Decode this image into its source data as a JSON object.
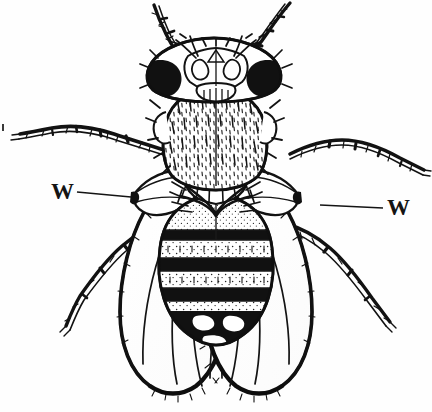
{
  "figure": {
    "kind": "scientific-line-drawing",
    "background_color": "#fefefe",
    "ink_color": "#111111",
    "width_px": 432,
    "height_px": 412
  },
  "labels": {
    "left": {
      "text": "W",
      "points_to": "left wing base",
      "leader_from_x": 77,
      "leader_from_y": 192,
      "leader_to_x": 131,
      "leader_to_y": 197
    },
    "right": {
      "text": "W",
      "points_to": "right wing base",
      "leader_from_x": 383,
      "leader_from_y": 208,
      "leader_to_x": 320,
      "leader_to_y": 205
    }
  },
  "anatomy": {
    "head": {
      "label": "head",
      "eye_fill": "#111111"
    },
    "thorax": {
      "label": "thorax",
      "texture": "short bristles"
    },
    "scutellum": {
      "label": "scutellum"
    },
    "abdomen": {
      "label": "abdomen",
      "bands": 5,
      "band_fill": "#111111"
    },
    "wings": {
      "label": "wings",
      "count": 2
    },
    "legs": {
      "label": "legs",
      "count": 6
    },
    "antennae": {
      "label": "antennae",
      "count": 2
    }
  }
}
